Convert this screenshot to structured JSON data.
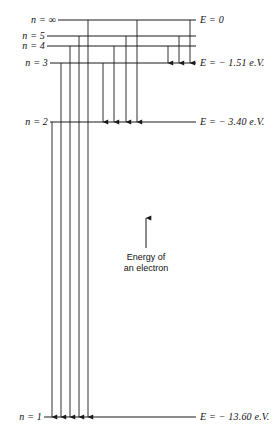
{
  "figure": {
    "width": 278,
    "height": 441,
    "background_color": "#ffffff",
    "line_color": "#1a1a1a"
  },
  "chart_data": {
    "type": "diagram",
    "xlabel": "",
    "ylabel": "Energy of an electron",
    "grid": false,
    "legend": false,
    "levels": [
      {
        "id": "level-infinity",
        "n_label": "n = ∞",
        "n_value": "∞",
        "energy_label": "E = 0",
        "energy_ev": 0.0,
        "y": 20,
        "x_start": 58,
        "x_end": 196
      },
      {
        "id": "level-5",
        "n_label": "n = 5",
        "n_value": "5",
        "energy_label": "",
        "energy_ev": -0.54,
        "y": 36,
        "x_start": 47,
        "x_end": 196
      },
      {
        "id": "level-4",
        "n_label": "n = 4",
        "n_value": "4",
        "energy_label": "",
        "energy_ev": -0.85,
        "y": 46,
        "x_start": 47,
        "x_end": 196
      },
      {
        "id": "level-3",
        "n_label": "n = 3",
        "n_value": "3",
        "energy_label": "E = − 1.51 e.V.",
        "energy_ev": -1.51,
        "y": 63,
        "x_start": 50,
        "x_end": 196
      },
      {
        "id": "level-2",
        "n_label": "n = 2",
        "n_value": "2",
        "energy_label": "E = − 3.40 e.V.",
        "energy_ev": -3.4,
        "y": 122,
        "x_start": 50,
        "x_end": 196
      },
      {
        "id": "level-1",
        "n_label": "n = 1",
        "n_value": "1",
        "energy_label": "E = − 13.60 e.V.",
        "energy_ev": -13.6,
        "y": 417,
        "x_start": 44,
        "x_end": 196
      }
    ],
    "transitions": [
      {
        "id": "t-inf-3",
        "x": 190,
        "y_from": 20,
        "y_to": 63,
        "to_level": "level-3"
      },
      {
        "id": "t-5-3",
        "x": 179,
        "y_from": 36,
        "y_to": 63,
        "to_level": "level-3"
      },
      {
        "id": "t-4-3",
        "x": 168,
        "y_from": 46,
        "y_to": 63,
        "to_level": "level-3"
      },
      {
        "id": "t-inf-2",
        "x": 137,
        "y_from": 20,
        "y_to": 122,
        "to_level": "level-2"
      },
      {
        "id": "t-5-2",
        "x": 126,
        "y_from": 36,
        "y_to": 122,
        "to_level": "level-2"
      },
      {
        "id": "t-4-2",
        "x": 114,
        "y_from": 46,
        "y_to": 122,
        "to_level": "level-2"
      },
      {
        "id": "t-3-2",
        "x": 103,
        "y_from": 63,
        "y_to": 122,
        "to_level": "level-2"
      },
      {
        "id": "t-inf-1",
        "x": 88,
        "y_from": 20,
        "y_to": 417,
        "to_level": "level-1"
      },
      {
        "id": "t-5-1",
        "x": 79,
        "y_from": 36,
        "y_to": 417,
        "to_level": "level-1"
      },
      {
        "id": "t-4-1",
        "x": 70,
        "y_from": 46,
        "y_to": 417,
        "to_level": "level-1"
      },
      {
        "id": "t-3-1",
        "x": 61,
        "y_from": 63,
        "y_to": 417,
        "to_level": "level-1"
      },
      {
        "id": "t-2-1",
        "x": 52,
        "y_from": 122,
        "y_to": 417,
        "to_level": "level-1"
      }
    ],
    "annotation": {
      "text_line1": "Energy of",
      "text_line2": "an electron",
      "arrow_x": 146,
      "arrow_y_top": 218,
      "arrow_y_bottom": 248,
      "label_x": 146,
      "label_y": 252
    }
  }
}
